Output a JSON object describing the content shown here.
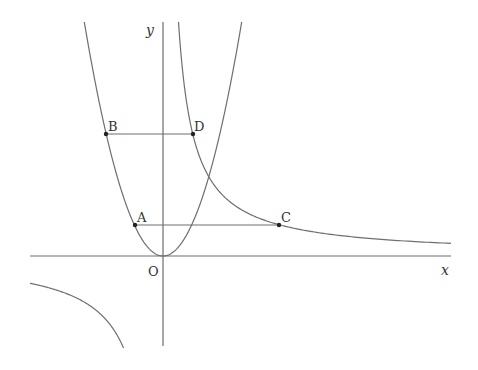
{
  "diagram": {
    "axes": {
      "x_label": "x",
      "y_label": "y",
      "origin_label": "O"
    },
    "curves": [
      {
        "name": "parabola",
        "equation": "y = a x^2",
        "color": "#6e6e6e"
      },
      {
        "name": "hyperbola",
        "equation": "y = k / x",
        "color": "#6e6e6e"
      }
    ],
    "points": {
      "A": {
        "label": "A",
        "on": "parabola"
      },
      "B": {
        "label": "B",
        "on": "parabola"
      },
      "C": {
        "label": "C",
        "on": "hyperbola"
      },
      "D": {
        "label": "D",
        "on": "hyperbola"
      }
    },
    "segments": [
      {
        "from": "A",
        "to": "C"
      },
      {
        "from": "B",
        "to": "D"
      }
    ],
    "colors": {
      "line": "#6e6e6e",
      "axis": "#6e6e6e",
      "point": "#222222",
      "text": "#333333"
    }
  }
}
